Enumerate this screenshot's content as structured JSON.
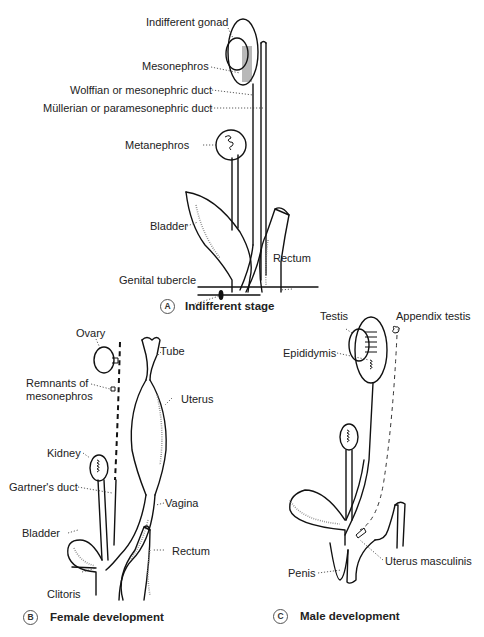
{
  "panels": {
    "a": {
      "badge": "A",
      "caption": "Indifferent stage",
      "labels": {
        "indifferent_gonad": "Indifferent gonad",
        "mesonephros": "Mesonephros",
        "wolffian_duct": "Wolffian or mesonephric duct",
        "mullerian_duct": "Müllerian or paramesonephric duct",
        "metanephros": "Metanephros",
        "bladder": "Bladder",
        "rectum": "Rectum",
        "genital_tubercle": "Genital tubercle"
      }
    },
    "b": {
      "badge": "B",
      "caption": "Female development",
      "labels": {
        "ovary": "Ovary",
        "tube": "Tube",
        "remnants_line1": "Remnants of",
        "remnants_line2": "mesonephros",
        "uterus": "Uterus",
        "kidney": "Kidney",
        "gartners_duct": "Gartner's duct",
        "vagina": "Vagina",
        "bladder": "Bladder",
        "rectum": "Rectum",
        "clitoris": "Clitoris"
      }
    },
    "c": {
      "badge": "C",
      "caption": "Male development",
      "labels": {
        "testis": "Testis",
        "appendix_testis": "Appendix testis",
        "epididymis": "Epididymis",
        "uterus_masculinis": "Uterus masculinis",
        "penis": "Penis"
      }
    }
  },
  "colors": {
    "ink": "#111111",
    "background": "#ffffff",
    "stipple": "#888888"
  }
}
